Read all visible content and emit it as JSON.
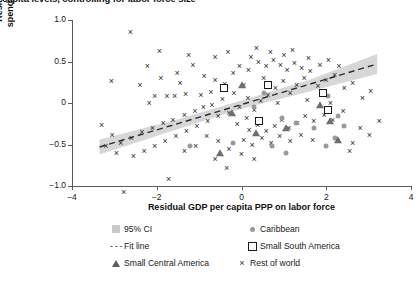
{
  "title": "capita levels, controlling for labor force size",
  "chart_data": {
    "type": "scatter",
    "title": "capita levels, controlling for labor force size",
    "xlabel": "Residual GDP per capita PPP on labor force",
    "ylabel": "Residual government spending on labor force",
    "xlim": [
      -4,
      4
    ],
    "ylim": [
      -1.0,
      1.0
    ],
    "xticks": [
      -4,
      -2,
      0,
      2,
      4
    ],
    "xtick_labels": [
      "−4",
      "−2",
      "0",
      "2",
      "4"
    ],
    "yticks": [
      1.0,
      0.5,
      0,
      -0.5,
      -1.0
    ],
    "ytick_labels": [
      "1.0",
      "0.5",
      "0",
      "−0.5",
      "−1.0"
    ],
    "grid": false,
    "legend_position": "bottom",
    "legend": [
      {
        "label": "95% CI",
        "marker": "band",
        "color": "#c9c9c9"
      },
      {
        "label": "Caribbean",
        "marker": "circle",
        "color": "#9a9a9a"
      },
      {
        "label": "Fit line",
        "marker": "dashed-line",
        "color": "#2c2c2c"
      },
      {
        "label": "Small South America",
        "marker": "open-square",
        "color": "#1a1a1a"
      },
      {
        "label": "Small Central America",
        "marker": "filled-triangle",
        "color": "#6e6e6e"
      },
      {
        "label": "Rest of world",
        "marker": "x",
        "color": "#2c2c2c"
      }
    ],
    "fit_line": {
      "x": [
        -3.35,
        3.2
      ],
      "y": [
        -0.53,
        0.47
      ],
      "slope": 0.153,
      "intercept": -0.018
    },
    "ci_band": {
      "x": [
        -3.35,
        -1.6,
        0.0,
        1.6,
        3.2
      ],
      "lower": [
        -0.62,
        -0.33,
        -0.07,
        0.14,
        0.35
      ],
      "upper": [
        -0.44,
        -0.21,
        0.03,
        0.28,
        0.59
      ]
    },
    "series": [
      {
        "name": "Rest of world",
        "marker": "x",
        "points": [
          [
            -2.62,
            0.86
          ],
          [
            -1.94,
            0.63
          ],
          [
            -2.22,
            0.44
          ],
          [
            -3.07,
            0.27
          ],
          [
            -1.52,
            0.36
          ],
          [
            -1.15,
            0.46
          ],
          [
            -0.88,
            0.33
          ],
          [
            -1.32,
            0.11
          ],
          [
            -1.58,
            0.08
          ],
          [
            -1.76,
            0.09
          ],
          [
            -2.05,
            0.08
          ],
          [
            -0.96,
            0.1
          ],
          [
            -0.72,
            0.13
          ],
          [
            -0.62,
            0.28
          ],
          [
            -0.4,
            0.23
          ],
          [
            -0.2,
            0.36
          ],
          [
            -0.05,
            0.44
          ],
          [
            0.16,
            0.4
          ],
          [
            0.05,
            0.22
          ],
          [
            -0.18,
            0.12
          ],
          [
            -0.45,
            0.05
          ],
          [
            -0.7,
            -0.02
          ],
          [
            -0.9,
            -0.05
          ],
          [
            -1.1,
            -0.1
          ],
          [
            -1.35,
            -0.14
          ],
          [
            -1.62,
            -0.2
          ],
          [
            -1.85,
            -0.24
          ],
          [
            -2.1,
            -0.3
          ],
          [
            -2.35,
            -0.35
          ],
          [
            -2.6,
            -0.42
          ],
          [
            -2.85,
            -0.48
          ],
          [
            -3.05,
            -0.38
          ],
          [
            -3.2,
            -0.52
          ],
          [
            -2.95,
            -0.6
          ],
          [
            -2.55,
            -0.64
          ],
          [
            -2.3,
            -0.58
          ],
          [
            -2.05,
            -0.52
          ],
          [
            -1.8,
            -0.46
          ],
          [
            -1.55,
            -0.4
          ],
          [
            -1.3,
            -0.34
          ],
          [
            -1.05,
            -0.28
          ],
          [
            -0.8,
            -0.22
          ],
          [
            -0.55,
            -0.16
          ],
          [
            -0.3,
            -0.12
          ],
          [
            -0.1,
            -0.25
          ],
          [
            0.12,
            -0.18
          ],
          [
            0.3,
            -0.08
          ],
          [
            0.45,
            0.02
          ],
          [
            0.62,
            0.1
          ],
          [
            0.8,
            0.18
          ],
          [
            0.98,
            0.26
          ],
          [
            1.15,
            0.12
          ],
          [
            1.3,
            0.22
          ],
          [
            1.48,
            0.3
          ],
          [
            1.62,
            0.38
          ],
          [
            1.8,
            0.2
          ],
          [
            2.0,
            0.28
          ],
          [
            2.2,
            0.34
          ],
          [
            2.42,
            0.18
          ],
          [
            2.62,
            0.24
          ],
          [
            2.85,
            0.06
          ],
          [
            3.05,
            0.14
          ],
          [
            0.22,
            0.56
          ],
          [
            0.4,
            0.5
          ],
          [
            0.58,
            0.44
          ],
          [
            0.75,
            0.52
          ],
          [
            0.92,
            0.46
          ],
          [
            1.08,
            0.4
          ],
          [
            1.25,
            0.48
          ],
          [
            1.42,
            0.42
          ],
          [
            0.35,
            0.66
          ],
          [
            0.68,
            0.62
          ],
          [
            1.0,
            0.58
          ],
          [
            1.2,
            0.64
          ],
          [
            -0.32,
            0.62
          ],
          [
            -0.62,
            0.56
          ],
          [
            1.58,
            0.54
          ],
          [
            1.85,
            0.46
          ],
          [
            2.05,
            0.52
          ],
          [
            2.3,
            0.44
          ],
          [
            0.18,
            -0.32
          ],
          [
            0.38,
            -0.26
          ],
          [
            0.58,
            -0.34
          ],
          [
            0.78,
            -0.28
          ],
          [
            0.95,
            -0.2
          ],
          [
            1.12,
            -0.3
          ],
          [
            1.32,
            -0.24
          ],
          [
            1.5,
            -0.16
          ],
          [
            1.7,
            -0.22
          ],
          [
            1.95,
            -0.14
          ],
          [
            2.15,
            -0.2
          ],
          [
            2.4,
            -0.1
          ],
          [
            0.05,
            -0.44
          ],
          [
            0.25,
            -0.5
          ],
          [
            0.48,
            -0.42
          ],
          [
            0.7,
            -0.48
          ],
          [
            0.9,
            -0.4
          ],
          [
            1.15,
            -0.46
          ],
          [
            1.4,
            -0.38
          ],
          [
            1.68,
            -0.44
          ],
          [
            -0.55,
            -0.46
          ],
          [
            -0.82,
            -0.4
          ],
          [
            -1.08,
            -0.52
          ],
          [
            -1.35,
            -0.58
          ],
          [
            -0.3,
            -0.56
          ],
          [
            0.0,
            -0.62
          ],
          [
            0.3,
            -0.68
          ],
          [
            -0.62,
            -0.68
          ],
          [
            -2.78,
            -1.07
          ],
          [
            -1.72,
            -0.92
          ],
          [
            -0.35,
            -0.78
          ],
          [
            2.62,
            -0.48
          ],
          [
            3.02,
            -0.38
          ],
          [
            2.8,
            -0.3
          ],
          [
            3.25,
            -0.22
          ],
          [
            2.55,
            -0.58
          ],
          [
            -1.25,
            0.58
          ],
          [
            -1.9,
            0.3
          ],
          [
            -2.4,
            0.22
          ],
          [
            -0.05,
            -0.05
          ],
          [
            0.15,
            0.06
          ],
          [
            0.85,
            0.0
          ],
          [
            1.55,
            0.04
          ],
          [
            2.1,
            0.0
          ],
          [
            -3.3,
            -0.26
          ],
          [
            -2.18,
            0.0
          ],
          [
            -1.45,
            0.24
          ],
          [
            0.52,
            0.3
          ]
        ]
      },
      {
        "name": "Caribbean",
        "marker": "circle",
        "points": [
          [
            0.52,
            0.12
          ],
          [
            0.95,
            -0.18
          ],
          [
            1.28,
            -0.24
          ],
          [
            1.72,
            -0.3
          ],
          [
            2.05,
            0.08
          ],
          [
            2.28,
            -0.16
          ],
          [
            2.42,
            -0.28
          ],
          [
            2.2,
            -0.42
          ],
          [
            -0.2,
            -0.48
          ],
          [
            -1.22,
            -0.52
          ],
          [
            0.72,
            -0.52
          ],
          [
            1.05,
            -0.6
          ],
          [
            2.0,
            -0.52
          ],
          [
            0.3,
            -0.05
          ]
        ]
      },
      {
        "name": "Small South America",
        "marker": "open-square",
        "points": [
          [
            -0.42,
            0.18
          ],
          [
            0.62,
            0.22
          ],
          [
            1.92,
            0.12
          ],
          [
            0.42,
            -0.22
          ],
          [
            2.05,
            -0.08
          ]
        ]
      },
      {
        "name": "Small Central America",
        "marker": "filled-triangle",
        "points": [
          [
            0.02,
            0.22
          ],
          [
            -0.22,
            -0.12
          ],
          [
            0.35,
            -0.36
          ],
          [
            1.85,
            -0.02
          ],
          [
            2.1,
            -0.22
          ],
          [
            2.28,
            -0.44
          ],
          [
            1.05,
            -0.3
          ],
          [
            -0.5,
            -0.6
          ]
        ]
      }
    ]
  }
}
